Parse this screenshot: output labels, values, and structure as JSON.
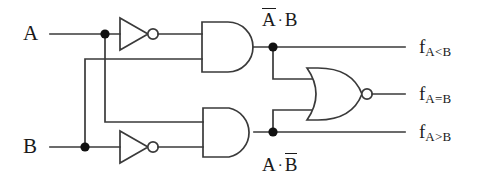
{
  "diagram": {
    "type": "logic-circuit",
    "stroke_color": "#3a3a3a",
    "text_color": "#1a1a1a",
    "background": "#ffffff"
  },
  "inputs": [
    {
      "id": "A",
      "label": "A",
      "x": 30,
      "y": 34
    },
    {
      "id": "B",
      "label": "B",
      "x": 30,
      "y": 147
    }
  ],
  "gates": [
    {
      "id": "not-a",
      "type": "NOT",
      "label": "inverter-a",
      "input": "A",
      "output": "A-bar"
    },
    {
      "id": "not-b",
      "type": "NOT",
      "label": "inverter-b",
      "input": "B",
      "output": "B-bar"
    },
    {
      "id": "and-top",
      "type": "AND",
      "label": "and-gate-top",
      "inputs": [
        "A-bar",
        "B"
      ],
      "output": "A-bar-and-B"
    },
    {
      "id": "and-bottom",
      "type": "AND",
      "label": "and-gate-bottom",
      "inputs": [
        "A",
        "B-bar"
      ],
      "output": "A-and-B-bar"
    },
    {
      "id": "nor",
      "type": "NOR",
      "label": "nor-gate",
      "inputs": [
        "A-bar-and-B",
        "A-and-B-bar"
      ],
      "output": "f-a-eq-b"
    }
  ],
  "terms": [
    {
      "id": "term-top",
      "text_a": "A",
      "text_op": "·",
      "text_b": "B",
      "overbar_on": "a",
      "x": 262,
      "y": 12
    },
    {
      "id": "term-bottom",
      "text_a": "A",
      "text_op": "·",
      "text_b": "B",
      "overbar_on": "b",
      "x": 262,
      "y": 155
    }
  ],
  "outputs": [
    {
      "id": "f-lt",
      "base": "f",
      "sub": "A<B",
      "x": 420,
      "y": 46,
      "source": "and-gate-top"
    },
    {
      "id": "f-eq",
      "base": "f",
      "sub": "A=B",
      "x": 420,
      "y": 93,
      "source": "nor-gate"
    },
    {
      "id": "f-gt",
      "base": "f",
      "sub": "A>B",
      "x": 420,
      "y": 131,
      "source": "and-gate-bottom"
    }
  ],
  "junctions": [
    {
      "id": "junction-a-input",
      "x": 105,
      "y": 34
    },
    {
      "id": "junction-b-input",
      "x": 85,
      "y": 147
    },
    {
      "id": "junction-and-top-out",
      "x": 273,
      "y": 57
    },
    {
      "id": "junction-and-bottom-out",
      "x": 273,
      "y": 130
    }
  ]
}
